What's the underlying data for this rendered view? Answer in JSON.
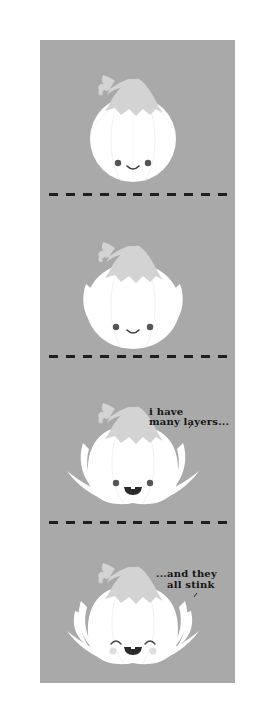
{
  "comic": {
    "background_color": "#a9a9a9",
    "onion_color": "#ffffff",
    "stem_color": "#d3d3d3",
    "panels": [
      {
        "id": 1,
        "expression": "smile",
        "caption": ""
      },
      {
        "id": 2,
        "expression": "smile",
        "caption": ""
      },
      {
        "id": 3,
        "expression": "open-mouth-smile",
        "caption": "i have\nmany layers..."
      },
      {
        "id": 4,
        "expression": "laughing-blush",
        "caption": "...and they\nall stink"
      }
    ],
    "captions": {
      "panel3_line1": "i have",
      "panel3_line2": "many layers...",
      "panel4_line1": "...and they",
      "panel4_line2": "all stink"
    },
    "separator_dash_count": 11
  }
}
